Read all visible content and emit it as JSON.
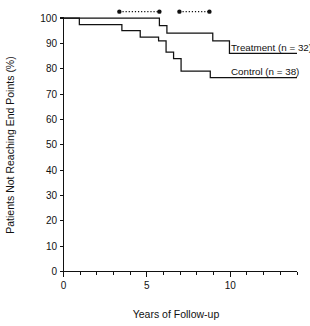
{
  "chart_data": {
    "type": "line",
    "subtype": "kaplan-meier-step",
    "title": "",
    "xlabel": "Years of Follow-up",
    "ylabel": "Patients Not Reaching End Points (%)",
    "xlim": [
      0,
      14
    ],
    "ylim": [
      0,
      100
    ],
    "grid": false,
    "legend_position": "inline-right",
    "x_ticks_major": [
      0,
      5,
      10
    ],
    "x_tick_labels": [
      "0",
      "5",
      "10"
    ],
    "x_ticks_minor": [
      1,
      2,
      3,
      4,
      6,
      7,
      8,
      9,
      11,
      12,
      13,
      14
    ],
    "y_ticks": [
      0,
      10,
      20,
      30,
      40,
      50,
      60,
      70,
      80,
      90,
      100
    ],
    "y_tick_labels": [
      "0",
      "10",
      "20",
      "30",
      "40",
      "50",
      "60",
      "70",
      "80",
      "90",
      "100"
    ],
    "series": [
      {
        "name": "Treatment (n = 32)",
        "label": "Treatment (n = 32)",
        "color": "#111111",
        "n": 32,
        "steps": [
          {
            "x": 0.0,
            "y": 100.0
          },
          {
            "x": 5.75,
            "y": 100.0
          },
          {
            "x": 5.75,
            "y": 97.0
          },
          {
            "x": 6.2,
            "y": 97.0
          },
          {
            "x": 6.2,
            "y": 94.0
          },
          {
            "x": 8.95,
            "y": 94.0
          },
          {
            "x": 8.95,
            "y": 91.0
          },
          {
            "x": 9.95,
            "y": 91.0
          },
          {
            "x": 9.95,
            "y": 86.0
          },
          {
            "x": 14.0,
            "y": 86.0
          }
        ]
      },
      {
        "name": "Control (n = 38)",
        "label": "Control (n = 38)",
        "color": "#111111",
        "n": 38,
        "steps": [
          {
            "x": 0.0,
            "y": 100.0
          },
          {
            "x": 0.95,
            "y": 100.0
          },
          {
            "x": 0.95,
            "y": 97.4
          },
          {
            "x": 3.5,
            "y": 97.4
          },
          {
            "x": 3.5,
            "y": 95.0
          },
          {
            "x": 4.6,
            "y": 95.0
          },
          {
            "x": 4.6,
            "y": 92.5
          },
          {
            "x": 5.7,
            "y": 92.5
          },
          {
            "x": 5.7,
            "y": 91.0
          },
          {
            "x": 6.15,
            "y": 91.0
          },
          {
            "x": 6.15,
            "y": 86.5
          },
          {
            "x": 6.6,
            "y": 86.5
          },
          {
            "x": 6.6,
            "y": 84.0
          },
          {
            "x": 7.05,
            "y": 84.0
          },
          {
            "x": 7.05,
            "y": 79.0
          },
          {
            "x": 8.8,
            "y": 79.0
          },
          {
            "x": 8.8,
            "y": 76.5
          },
          {
            "x": 14.0,
            "y": 76.5
          }
        ]
      }
    ],
    "annotations": [
      {
        "name": "interval-bar-1",
        "y": 102.5,
        "x_start": 3.35,
        "x_end": 5.75,
        "style": "dotted-with-endpoint-dots"
      },
      {
        "name": "interval-bar-2",
        "y": 102.5,
        "x_start": 6.95,
        "x_end": 8.75,
        "style": "dotted-with-endpoint-dots"
      }
    ]
  },
  "axis": {
    "y_title": "Patients Not Reaching End Points (%)",
    "x_title": "Years of Follow-up"
  },
  "labels": {
    "treatment": "Treatment (n = 32)",
    "control": "Control (n = 38)"
  },
  "colors": {
    "ink": "#111111",
    "background": "#ffffff"
  }
}
